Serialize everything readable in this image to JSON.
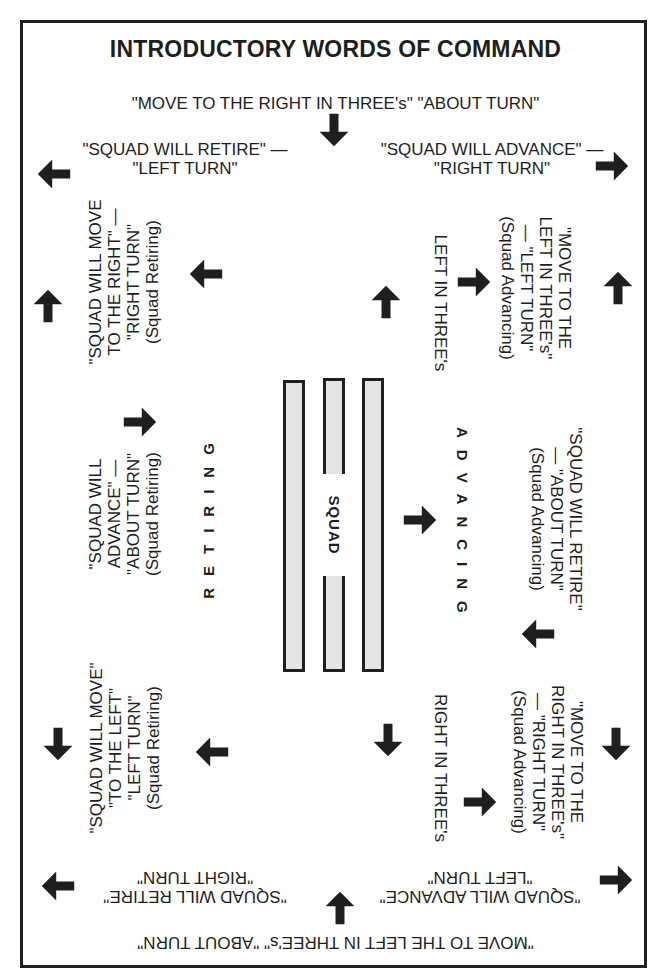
{
  "title": "INTRODUCTORY WORDS OF COMMAND",
  "top": {
    "main": "\"MOVE TO THE RIGHT IN THREE's\"  \"ABOUT TURN\"",
    "left_line1": "\"SQUAD WILL RETIRE\" —",
    "left_line2": "\"LEFT TURN\"",
    "right_line1": "\"SQUAD WILL ADVANCE\" —",
    "right_line2": "\"RIGHT TURN\""
  },
  "bottom": {
    "main": "\"MOVE TO THE LEFT IN THREE's\"  \"ABOUT TURN\"",
    "left_line1": "\"SQUAD WILL RETIRE\"",
    "left_line2": "\"RIGHT TURN\"",
    "right_line1": "\"SQUAD WILL ADVANCE\"",
    "right_line2": "\"LEFT TURN\""
  },
  "left_side": {
    "upper": [
      "\"SQUAD WILL MOVE",
      "TO THE RIGHT\" —",
      "\"RIGHT TURN\"",
      "(Squad Retiring)"
    ],
    "middle": [
      "\"SQUAD WILL",
      "ADVANCE\" —",
      "\"ABOUT TURN\"",
      "(Squad Retiring)"
    ],
    "lower": [
      "\"SQUAD WILL MOVE\"",
      "\"TO THE LEFT\"",
      "\"LEFT TURN\"",
      "(Squad Retiring)"
    ],
    "direction_label": "RETIRING"
  },
  "right_side": {
    "upper": [
      "\"MOVE TO THE",
      "LEFT IN THREE's\"",
      "— \"LEFT TURN\"",
      "(Squad Advancing)"
    ],
    "middle": [
      "\"SQUAD WILL RETIRE\"",
      "— \"ABOUT TURN\"",
      "(Squad Advancing)"
    ],
    "lower": [
      "\"MOVE TO THE",
      "RIGHT IN THREE's\"",
      "— \"RIGHT TURN\"",
      "(Squad Advancing)"
    ],
    "direction_label": "ADVANCING"
  },
  "center": {
    "squad_label": "SQUAD",
    "left_in_threes": "LEFT IN THREE's",
    "right_in_threes": "RIGHT IN THREE's"
  },
  "colors": {
    "ink": "#1f1f1f",
    "bar_fill": "#e4e4e4",
    "paper": "#ffffff"
  },
  "arrows": [
    {
      "name": "top-center",
      "direction": "down"
    },
    {
      "name": "top-left-corner",
      "direction": "left"
    },
    {
      "name": "top-right-corner",
      "direction": "right"
    },
    {
      "name": "left-edge-upper",
      "direction": "up"
    },
    {
      "name": "left-upper-inner",
      "direction": "left"
    },
    {
      "name": "left-middle-inner",
      "direction": "right"
    },
    {
      "name": "left-edge-lower",
      "direction": "down"
    },
    {
      "name": "left-lower-inner",
      "direction": "left"
    },
    {
      "name": "left-in-threes",
      "direction": "up"
    },
    {
      "name": "right-upper-inner",
      "direction": "right"
    },
    {
      "name": "right-edge-upper",
      "direction": "up"
    },
    {
      "name": "advancing",
      "direction": "right"
    },
    {
      "name": "right-middle-inner",
      "direction": "left"
    },
    {
      "name": "right-in-threes",
      "direction": "down"
    },
    {
      "name": "right-edge-lower",
      "direction": "down"
    },
    {
      "name": "right-lower-inner",
      "direction": "right"
    },
    {
      "name": "bottom-center",
      "direction": "up"
    },
    {
      "name": "bottom-left-corner",
      "direction": "left"
    },
    {
      "name": "bottom-right-corner",
      "direction": "right"
    }
  ]
}
